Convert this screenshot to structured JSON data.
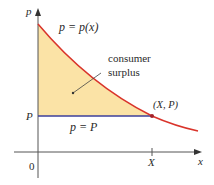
{
  "diagram": {
    "title": "Consumer surplus",
    "axes": {
      "y_label": "p",
      "x_label": "x",
      "origin_label": "0"
    },
    "curve_label": "p = p(x)",
    "price_line_label": "p = P",
    "price_tick_label": "P",
    "quantity_tick_label": "X",
    "point_label": "(X, P)",
    "region_label_line1": "consumer",
    "region_label_line2": "surplus",
    "colors": {
      "curve": "#d9342b",
      "price_line": "#3c3f9a",
      "shaded_region": "#fbe3a6",
      "axes": "#555555",
      "text": "#2a2a2a"
    }
  }
}
